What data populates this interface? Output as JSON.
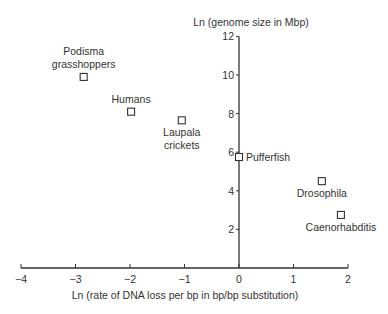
{
  "chart_data": {
    "type": "scatter",
    "title": "",
    "xlabel": "Ln (rate of DNA loss per bp in bp/bp substitution)",
    "ylabel": "Ln (genome size in Mbp)",
    "xlim": [
      -4,
      2
    ],
    "ylim": [
      0,
      12
    ],
    "xticks": [
      -4,
      -3,
      -2,
      -1,
      0,
      1,
      2
    ],
    "xtick_labels": [
      "−4",
      "−3",
      "−2",
      "−1",
      "0",
      "1",
      "2"
    ],
    "yticks": [
      2,
      4,
      6,
      8,
      10,
      12
    ],
    "ytick_labels": [
      "2",
      "4",
      "6",
      "8",
      "10",
      "12"
    ],
    "grid": false,
    "legend": null,
    "marker": "open-square",
    "points": [
      {
        "name": "Podisma grasshoppers",
        "label_lines": [
          "Podisma",
          "grasshoppers"
        ],
        "x": -2.85,
        "y": 9.9,
        "label_pos": "above"
      },
      {
        "name": "Humans",
        "label_lines": [
          "Humans"
        ],
        "x": -1.98,
        "y": 8.1,
        "label_pos": "above"
      },
      {
        "name": "Laupala crickets",
        "label_lines": [
          "Laupala",
          "crickets"
        ],
        "x": -1.05,
        "y": 7.65,
        "label_pos": "below"
      },
      {
        "name": "Pufferfish",
        "label_lines": [
          "Pufferfish"
        ],
        "x": 0.0,
        "y": 5.75,
        "label_pos": "right"
      },
      {
        "name": "Drosophila",
        "label_lines": [
          "Drosophila"
        ],
        "x": 1.52,
        "y": 4.5,
        "label_pos": "below"
      },
      {
        "name": "Caenorhabditis",
        "label_lines": [
          "Caenorhabditis"
        ],
        "x": 1.87,
        "y": 2.75,
        "label_pos": "below"
      }
    ]
  }
}
